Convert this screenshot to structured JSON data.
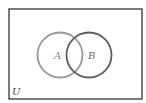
{
  "diagram": {
    "type": "venn",
    "universe_label": "U",
    "sets": [
      {
        "label": "A",
        "cx": 60,
        "cy": 55,
        "r": 22.5,
        "stroke": "#9a9a9a"
      },
      {
        "label": "B",
        "cx": 89,
        "cy": 55,
        "r": 22.5,
        "stroke": "#5e5e5e"
      }
    ],
    "frame": {
      "x": 9,
      "y": 9,
      "width": 133,
      "height": 90,
      "stroke": "#333333"
    }
  }
}
